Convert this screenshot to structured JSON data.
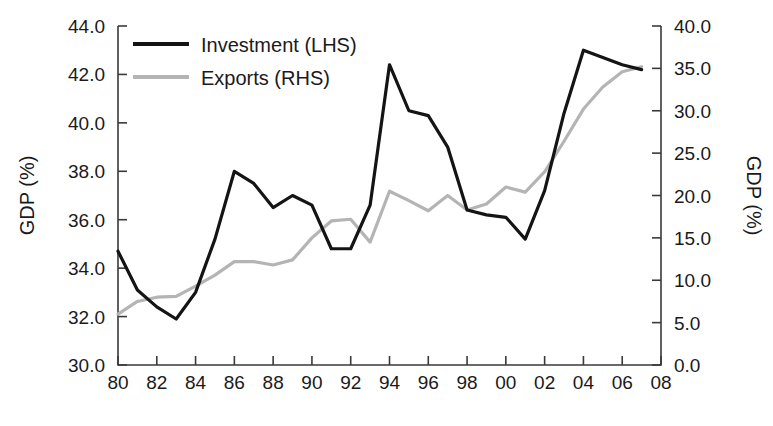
{
  "chart_data": {
    "type": "line",
    "title": "",
    "subtitle": "",
    "xlabel": "",
    "ylabel": "GDP (%)",
    "ylabel_right": "GDP (%)",
    "grid": false,
    "legend_position": "top-left",
    "x": [
      1980,
      1981,
      1982,
      1983,
      1984,
      1985,
      1986,
      1987,
      1988,
      1989,
      1990,
      1991,
      1992,
      1993,
      1994,
      1995,
      1996,
      1997,
      1998,
      1999,
      2000,
      2001,
      2002,
      2003,
      2004,
      2005,
      2006,
      2007
    ],
    "xtick_labels": [
      "80",
      "82",
      "84",
      "86",
      "88",
      "90",
      "92",
      "94",
      "96",
      "98",
      "00",
      "02",
      "04",
      "06",
      "08"
    ],
    "xtick_values": [
      1980,
      1982,
      1984,
      1986,
      1988,
      1990,
      1992,
      1994,
      1996,
      1998,
      2000,
      2002,
      2004,
      2006,
      2008
    ],
    "xlim": [
      1979.5,
      2008.2
    ],
    "ylim_left": [
      30.0,
      44.0
    ],
    "ytick_labels_left": [
      "30.0",
      "32.0",
      "34.0",
      "36.0",
      "38.0",
      "40.0",
      "42.0",
      "44.0"
    ],
    "ytick_values_left": [
      30.0,
      32.0,
      34.0,
      36.0,
      38.0,
      40.0,
      42.0,
      44.0
    ],
    "ylim_right": [
      0.0,
      40.0
    ],
    "ytick_labels_right": [
      "0.0",
      "5.0",
      "10.0",
      "15.0",
      "20.0",
      "25.0",
      "30.0",
      "35.0",
      "40.0"
    ],
    "ytick_values_right": [
      0.0,
      5.0,
      10.0,
      15.0,
      20.0,
      25.0,
      30.0,
      35.0,
      40.0
    ],
    "series": [
      {
        "name": "Investment (LHS)",
        "axis": "left",
        "color": "#141414",
        "width": 3.2,
        "values": [
          34.7,
          33.1,
          32.4,
          31.9,
          33.0,
          35.2,
          38.0,
          37.5,
          36.5,
          37.0,
          36.6,
          34.8,
          34.8,
          36.6,
          42.4,
          40.5,
          40.3,
          39.0,
          36.4,
          36.2,
          36.1,
          35.2,
          37.2,
          40.4,
          43.0,
          42.7,
          42.4,
          42.2
        ]
      },
      {
        "name": "Exports (RHS)",
        "axis": "right",
        "color": "#b4b4b4",
        "width": 3.2,
        "values": [
          6.0,
          7.5,
          8.0,
          8.1,
          9.3,
          10.6,
          12.2,
          12.2,
          11.8,
          12.4,
          15.0,
          17.0,
          17.2,
          14.5,
          20.5,
          19.4,
          18.2,
          20.0,
          18.3,
          19.0,
          21.0,
          20.4,
          22.8,
          26.4,
          30.2,
          32.8,
          34.6,
          35.2
        ]
      }
    ]
  },
  "legend": {
    "items": [
      {
        "label": "Investment (LHS)",
        "color": "#141414"
      },
      {
        "label": "Exports (RHS)",
        "color": "#b4b4b4"
      }
    ]
  },
  "axes": {
    "left_title": "GDP (%)",
    "right_title": "GDP (%)"
  }
}
